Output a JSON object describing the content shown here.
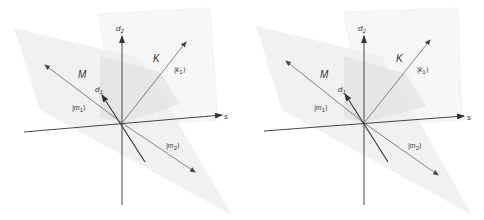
{
  "diagram": {
    "layout": "stereo-pair",
    "panels": [
      {
        "id": "left",
        "offset_x": 0
      },
      {
        "id": "right",
        "offset_x": 242
      }
    ],
    "colors": {
      "background": "#ffffff",
      "axis": "#333333",
      "vector": "#555555",
      "plane_M": "#eeeeee",
      "plane_K": "#e6e6e6",
      "box_edge": "#e0e0e0"
    },
    "labels": {
      "d2": {
        "base": "d",
        "sub": "2"
      },
      "d1": {
        "base": "d",
        "sub": "1"
      },
      "s": "s",
      "M": "M",
      "K": "K",
      "k1": {
        "open": "|k",
        "sub": "1",
        "close": "⟩"
      },
      "m1": {
        "open": "|m",
        "sub": "1",
        "close": "⟩"
      },
      "m2": {
        "open": "|m",
        "sub": "2",
        "close": "⟩"
      }
    },
    "elements": [
      "axis-d2",
      "axis-s",
      "axis-d1",
      "vector-k1",
      "vector-m1",
      "vector-m2",
      "plane-M",
      "plane-K"
    ]
  }
}
